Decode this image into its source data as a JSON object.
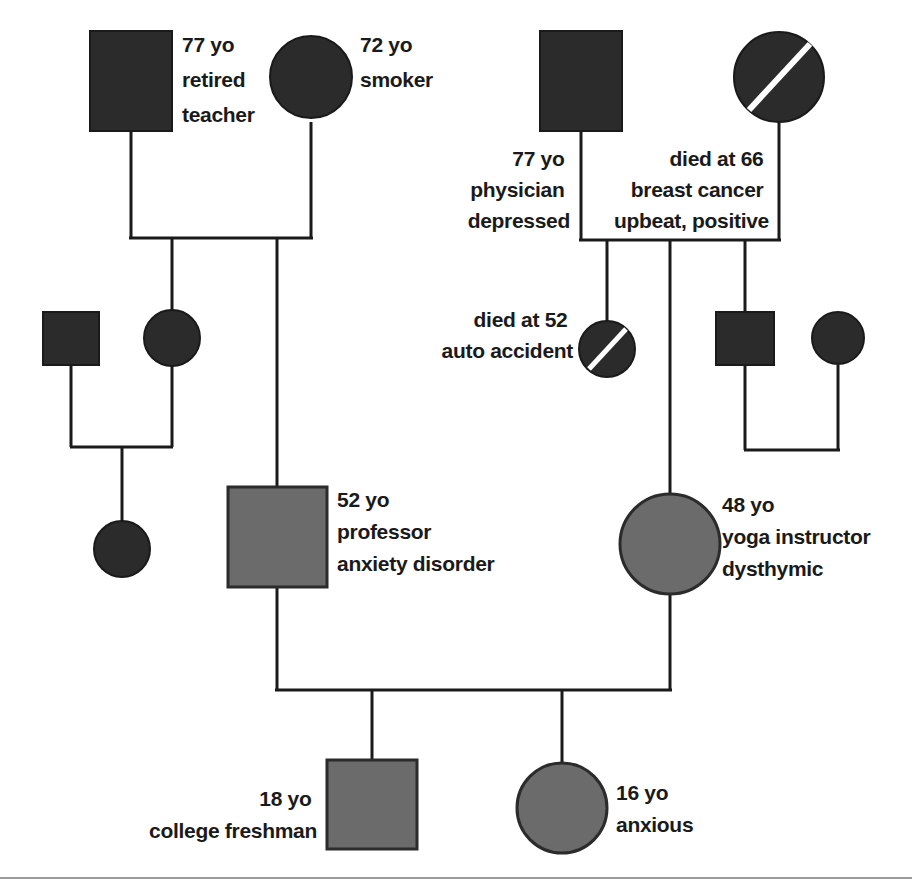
{
  "diagram": {
    "type": "genogram",
    "canvas": {
      "width": 912,
      "height": 891,
      "background": "#ffffff"
    },
    "colors": {
      "filled_black": "#2b2b2b",
      "filled_gray": "#6b6b6b",
      "line": "#1a1a1a",
      "text": "#1a1a1a",
      "deceased_slash": "#ffffff",
      "footer_rule": "#9a9a9a"
    },
    "legend_note": "Black shapes = older generations; gray shapes = index family; diagonal slash = deceased; square = male; circle = female"
  },
  "people": [
    {
      "id": "gp1-male",
      "shape": "square",
      "sex": "male",
      "fill": "black",
      "deceased": false,
      "label_side": "right",
      "lines": [
        "77 yo",
        "retired",
        "teacher"
      ]
    },
    {
      "id": "gp1-female",
      "shape": "circle",
      "sex": "female",
      "fill": "black",
      "deceased": false,
      "label_side": "right",
      "lines": [
        "72 yo",
        "smoker"
      ]
    },
    {
      "id": "gp2-male",
      "shape": "square",
      "sex": "male",
      "fill": "black",
      "deceased": false,
      "label_side": "below-left",
      "lines": [
        "77 yo",
        "physician",
        "depressed"
      ]
    },
    {
      "id": "gp2-female",
      "shape": "circle",
      "sex": "female",
      "fill": "black",
      "deceased": true,
      "label_side": "below-left",
      "lines": [
        "died at 66",
        "breast cancer",
        "upbeat, positive"
      ]
    },
    {
      "id": "g2-left-male-spouse",
      "shape": "square",
      "sex": "male",
      "fill": "black",
      "deceased": false,
      "label_side": "none",
      "lines": []
    },
    {
      "id": "g2-left-female",
      "shape": "circle",
      "sex": "female",
      "fill": "black",
      "deceased": false,
      "label_side": "none",
      "lines": []
    },
    {
      "id": "g3-left-child",
      "shape": "circle",
      "sex": "female",
      "fill": "black",
      "deceased": false,
      "label_side": "none",
      "lines": []
    },
    {
      "id": "g2-deceased-sister",
      "shape": "circle",
      "sex": "female",
      "fill": "black",
      "deceased": true,
      "label_side": "left",
      "lines": [
        "died at 52",
        "auto accident"
      ]
    },
    {
      "id": "g2-right-male",
      "shape": "square",
      "sex": "male",
      "fill": "black",
      "deceased": false,
      "label_side": "none",
      "lines": []
    },
    {
      "id": "g2-right-female-spouse",
      "shape": "circle",
      "sex": "female",
      "fill": "black",
      "deceased": false,
      "label_side": "none",
      "lines": []
    },
    {
      "id": "index-male",
      "shape": "square",
      "sex": "male",
      "fill": "gray",
      "deceased": false,
      "label_side": "right",
      "lines": [
        "52 yo",
        "professor",
        "anxiety disorder"
      ]
    },
    {
      "id": "index-female",
      "shape": "circle",
      "sex": "female",
      "fill": "gray",
      "deceased": false,
      "label_side": "right",
      "lines": [
        "48 yo",
        "yoga instructor",
        "dysthymic"
      ]
    },
    {
      "id": "child-son",
      "shape": "square",
      "sex": "male",
      "fill": "gray",
      "deceased": false,
      "label_side": "left",
      "lines": [
        "18 yo",
        "college freshman"
      ]
    },
    {
      "id": "child-daughter",
      "shape": "circle",
      "sex": "female",
      "fill": "gray",
      "deceased": false,
      "label_side": "right",
      "lines": [
        "16 yo",
        "anxious"
      ]
    }
  ],
  "labels": {
    "gp1_male_l1": "77 yo",
    "gp1_male_l2": "retired",
    "gp1_male_l3": "teacher",
    "gp1_female_l1": "72 yo",
    "gp1_female_l2": "smoker",
    "gp2_male_l1": "77 yo",
    "gp2_male_l2": "physician",
    "gp2_male_l3": "depressed",
    "gp2_female_l1": "died at 66",
    "gp2_female_l2": "breast cancer",
    "gp2_female_l3": "upbeat, positive",
    "deceased_sister_l1": "died at 52",
    "deceased_sister_l2": "auto accident",
    "index_male_l1": "52 yo",
    "index_male_l2": "professor",
    "index_male_l3": "anxiety disorder",
    "index_female_l1": "48 yo",
    "index_female_l2": "yoga instructor",
    "index_female_l3": "dysthymic",
    "son_l1": "18 yo",
    "son_l2": "college freshman",
    "daughter_l1": "16 yo",
    "daughter_l2": "anxious"
  }
}
